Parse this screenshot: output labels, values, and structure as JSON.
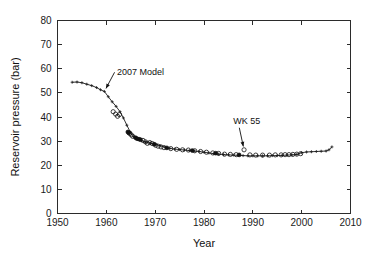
{
  "chart_data": {
    "type": "line",
    "title": "",
    "xlabel": "Year",
    "ylabel": "Reservoir pressure (bar)",
    "xlim": [
      1950,
      2010
    ],
    "ylim": [
      0,
      80
    ],
    "xticks": [
      1950,
      1960,
      1970,
      1980,
      1990,
      2000,
      2010
    ],
    "yticks": [
      0,
      10,
      20,
      30,
      40,
      50,
      60,
      70,
      80
    ],
    "grid": false,
    "legend_position": "none",
    "annotations": [
      {
        "text": "2007 Model",
        "text_x": 1962.2,
        "text_y": 57.5,
        "target_x": 1959.6,
        "target_y": 50.6
      },
      {
        "text": "WK 55",
        "text_x": 1986.0,
        "text_y": 37.0,
        "target_x": 1988.2,
        "target_y": 26.4
      }
    ],
    "series": [
      {
        "name": "2007 Model",
        "style": "line-with-plus-markers",
        "marker": "plus",
        "points": [
          [
            1953.0,
            54.4
          ],
          [
            1954.0,
            54.5
          ],
          [
            1955.0,
            54.2
          ],
          [
            1956.0,
            53.6
          ],
          [
            1957.0,
            53.0
          ],
          [
            1958.0,
            52.2
          ],
          [
            1958.8,
            51.3
          ],
          [
            1959.6,
            50.6
          ],
          [
            1960.4,
            48.4
          ],
          [
            1961.2,
            46.3
          ],
          [
            1962.0,
            44.4
          ],
          [
            1962.8,
            42.2
          ],
          [
            1963.5,
            39.6
          ],
          [
            1964.2,
            36.6
          ],
          [
            1964.9,
            33.8
          ],
          [
            1965.6,
            31.8
          ],
          [
            1966.4,
            30.8
          ],
          [
            1967.2,
            30.2
          ],
          [
            1968.0,
            29.6
          ],
          [
            1969.0,
            29.2
          ],
          [
            1970.0,
            28.6
          ],
          [
            1971.0,
            28.1
          ],
          [
            1972.0,
            27.5
          ],
          [
            1973.0,
            27.0
          ],
          [
            1974.0,
            26.7
          ],
          [
            1975.0,
            26.5
          ],
          [
            1976.0,
            26.3
          ],
          [
            1977.0,
            26.1
          ],
          [
            1978.0,
            25.9
          ],
          [
            1979.0,
            25.7
          ],
          [
            1980.0,
            25.4
          ],
          [
            1981.0,
            25.1
          ],
          [
            1982.0,
            24.8
          ],
          [
            1983.0,
            24.6
          ],
          [
            1984.0,
            24.4
          ],
          [
            1985.0,
            24.3
          ],
          [
            1986.0,
            24.2
          ],
          [
            1987.0,
            24.1
          ],
          [
            1988.0,
            24.0
          ],
          [
            1989.0,
            23.9
          ],
          [
            1990.0,
            23.9
          ],
          [
            1991.0,
            23.9
          ],
          [
            1992.0,
            23.9
          ],
          [
            1993.0,
            23.9
          ],
          [
            1994.0,
            24.0
          ],
          [
            1995.0,
            24.0
          ],
          [
            1996.0,
            24.1
          ],
          [
            1997.0,
            24.2
          ],
          [
            1998.0,
            24.3
          ],
          [
            1999.0,
            24.5
          ],
          [
            2000.0,
            25.2
          ],
          [
            2001.0,
            25.5
          ],
          [
            2002.0,
            25.6
          ],
          [
            2003.0,
            25.7
          ],
          [
            2004.0,
            25.8
          ],
          [
            2005.0,
            25.9
          ],
          [
            2005.6,
            26.4
          ],
          [
            2006.2,
            27.6
          ]
        ]
      },
      {
        "name": "WK 55 measured (open)",
        "style": "open-markers",
        "marker": "circle",
        "points": [
          [
            1961.4,
            42.2
          ],
          [
            1961.9,
            41.2
          ],
          [
            1962.3,
            40.3
          ],
          [
            1962.7,
            41.0
          ],
          [
            1964.8,
            33.2
          ],
          [
            1965.1,
            32.6
          ],
          [
            1965.4,
            32.0
          ],
          [
            1967.5,
            30.3
          ],
          [
            1968.0,
            29.7
          ],
          [
            1968.4,
            29.1
          ],
          [
            1968.9,
            29.4
          ],
          [
            1969.4,
            29.0
          ],
          [
            1970.1,
            28.3
          ],
          [
            1970.6,
            27.9
          ],
          [
            1971.2,
            27.6
          ],
          [
            1971.8,
            27.3
          ],
          [
            1973.2,
            26.9
          ],
          [
            1974.4,
            26.6
          ],
          [
            1975.6,
            26.4
          ],
          [
            1976.8,
            26.3
          ],
          [
            1978.1,
            26.0
          ],
          [
            1979.3,
            25.7
          ],
          [
            1980.5,
            25.4
          ],
          [
            1981.8,
            25.1
          ],
          [
            1983.0,
            24.9
          ],
          [
            1984.2,
            24.6
          ],
          [
            1985.4,
            24.5
          ],
          [
            1986.6,
            24.4
          ],
          [
            1988.2,
            26.4
          ],
          [
            1989.4,
            24.3
          ],
          [
            1990.6,
            24.2
          ],
          [
            1992.0,
            24.2
          ],
          [
            1993.4,
            24.2
          ],
          [
            1994.6,
            24.3
          ],
          [
            1995.8,
            24.3
          ],
          [
            1996.6,
            24.4
          ],
          [
            1997.4,
            24.4
          ],
          [
            1998.2,
            24.5
          ],
          [
            1999.0,
            24.6
          ],
          [
            1999.8,
            24.8
          ]
        ]
      },
      {
        "name": "WK 55 measured (filled)",
        "style": "filled-markers",
        "marker": "circle",
        "points": [
          [
            1964.4,
            33.8
          ],
          [
            1964.6,
            33.4
          ],
          [
            1966.0,
            31.4
          ],
          [
            1966.3,
            31.0
          ],
          [
            1966.7,
            30.8
          ],
          [
            1967.0,
            30.6
          ],
          [
            1969.8,
            28.7
          ],
          [
            1972.4,
            27.2
          ],
          [
            1977.6,
            26.1
          ],
          [
            1982.4,
            25.0
          ],
          [
            1987.2,
            24.3
          ]
        ]
      }
    ]
  },
  "axes": {
    "xtick_labels": [
      "1950",
      "1960",
      "1970",
      "1980",
      "1990",
      "2000",
      "2010"
    ],
    "ytick_labels": [
      "0",
      "10",
      "20",
      "30",
      "40",
      "50",
      "60",
      "70",
      "80"
    ],
    "x_title": "Year",
    "y_title": "Reservoir pressure (bar)"
  },
  "annotation_labels": {
    "model": "2007 Model",
    "well": "WK 55"
  },
  "colors": {
    "axis": "#2b2b2b",
    "line": "#1b1b1b",
    "marker": "#111111",
    "background": "#ffffff"
  }
}
